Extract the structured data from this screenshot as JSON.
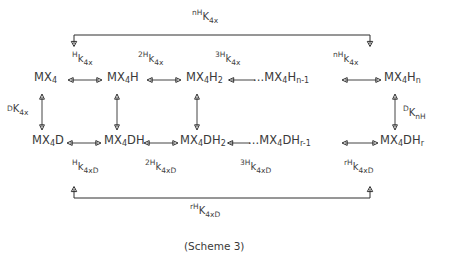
{
  "chart_data": {
    "type": "diagram",
    "title": "(Scheme 3)",
    "grid": false,
    "legend": null,
    "nodes": {
      "top_row": [
        {
          "id": "mx4",
          "label": "MX4",
          "html": "MX<sub>4</sub>"
        },
        {
          "id": "mx4h",
          "label": "MX4H",
          "html": "MX<sub>4</sub>H"
        },
        {
          "id": "mx4h2",
          "label": "MX4H2",
          "html": "MX<sub>4</sub>H<sub>2</sub>"
        },
        {
          "id": "mx4hn1",
          "label": "...MX4Hn-1",
          "html": "...MX<sub>4</sub>H<sub>n-1</sub>"
        },
        {
          "id": "mx4hn",
          "label": "MX4Hn",
          "html": "MX<sub>4</sub>H<sub>n</sub>"
        }
      ],
      "bottom_row": [
        {
          "id": "mx4d",
          "label": "MX4D",
          "html": "MX<sub>4</sub>D"
        },
        {
          "id": "mx4dh",
          "label": "MX4DH",
          "html": "MX<sub>4</sub>DH"
        },
        {
          "id": "mx4dh2",
          "label": "MX4DH2",
          "html": "MX<sub>4</sub>DH<sub>2</sub>"
        },
        {
          "id": "mx4dhr1",
          "label": "...MX4DHr-1",
          "html": "...MX<sub>4</sub>DH<sub>r-1</sub>"
        },
        {
          "id": "mx4dhr",
          "label": "MX4DHr",
          "html": "MX<sub>4</sub>DH<sub>r</sub>"
        }
      ]
    },
    "constants": {
      "outer_top": {
        "pre": "nH",
        "base": "K",
        "sub": "4x"
      },
      "outer_bottom": {
        "pre": "rH",
        "base": "K",
        "sub": "4xD"
      },
      "top_steps": [
        {
          "pre": "H",
          "base": "k",
          "sub": "4x"
        },
        {
          "pre": "2H",
          "base": "k",
          "sub": "4x"
        },
        {
          "pre": "3H",
          "base": "k",
          "sub": "4x"
        },
        {
          "pre": "nH",
          "base": "k",
          "sub": "4x"
        }
      ],
      "bottom_steps": [
        {
          "pre": "H",
          "base": "k",
          "sub": "4xD"
        },
        {
          "pre": "2H",
          "base": "k",
          "sub": "4xD"
        },
        {
          "pre": "3H",
          "base": "k",
          "sub": "4xD"
        },
        {
          "pre": "rH",
          "base": "k",
          "sub": "4xD"
        }
      ],
      "vertical_left": {
        "pre": "D",
        "base": "K",
        "sub": "4x"
      },
      "vertical_right": {
        "pre": "D",
        "base": "K",
        "sub": "nH"
      }
    },
    "colors": {
      "ink": "#2f2f2f",
      "text": "#3a3a3a",
      "background": "#ffffff"
    }
  },
  "caption": "(Scheme 3)"
}
